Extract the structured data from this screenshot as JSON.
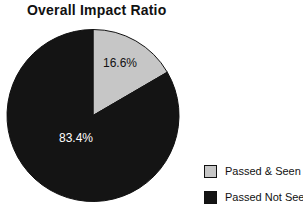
{
  "chart_data": {
    "type": "pie",
    "title": "Overall Impact Ratio",
    "start_angle_deg": -90,
    "direction": "clockwise",
    "legend_position": "bottom-right",
    "background": "#ffffff",
    "outline_color": "#111111",
    "slices": [
      {
        "label": "Passed & Seen",
        "value": 16.6,
        "display": "16.6%",
        "color": "#c6c6c6",
        "text_color": "#111111"
      },
      {
        "label": "Passed Not Seen",
        "value": 83.4,
        "display": "83.4%",
        "color": "#141414",
        "text_color": "#ffffff"
      }
    ]
  },
  "legend": {
    "items": [
      {
        "label": "Passed & Seen"
      },
      {
        "label": "Passed Not Seen"
      }
    ]
  }
}
